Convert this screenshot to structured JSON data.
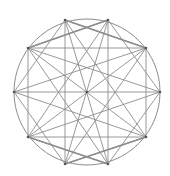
{
  "diagram": {
    "type": "geometric-construction",
    "canvas": {
      "width": 170,
      "height": 176,
      "background": "#ffffff"
    },
    "stroke_color": "#8c8c8c",
    "point_color": "#555555",
    "circle": {
      "cx": 87,
      "cy": 92,
      "r": 73
    },
    "center": {
      "x": 87,
      "y": 92
    },
    "points": [
      {
        "id": "T1",
        "x": 65,
        "y": 20
      },
      {
        "id": "T2",
        "x": 108,
        "y": 20
      },
      {
        "id": "R1",
        "x": 146,
        "y": 48
      },
      {
        "id": "R",
        "x": 160,
        "y": 92
      },
      {
        "id": "R2",
        "x": 146,
        "y": 137
      },
      {
        "id": "B2",
        "x": 108,
        "y": 164
      },
      {
        "id": "B1",
        "x": 65,
        "y": 164
      },
      {
        "id": "L2",
        "x": 28,
        "y": 137
      },
      {
        "id": "L",
        "x": 14,
        "y": 92
      },
      {
        "id": "L1",
        "x": 28,
        "y": 48
      }
    ],
    "chords": [
      [
        "L1",
        "R1"
      ],
      [
        "L2",
        "R2"
      ],
      [
        "L1",
        "L2"
      ],
      [
        "R1",
        "R2"
      ],
      [
        "L",
        "R"
      ],
      [
        "T1",
        "B2"
      ],
      [
        "T2",
        "B1"
      ],
      [
        "L1",
        "R2"
      ],
      [
        "R1",
        "L2"
      ],
      [
        "T1",
        "R1"
      ],
      [
        "T2",
        "L1"
      ],
      [
        "T1",
        "L"
      ],
      [
        "T2",
        "R"
      ],
      [
        "B1",
        "L"
      ],
      [
        "B2",
        "R"
      ],
      [
        "B1",
        "R2"
      ],
      [
        "B2",
        "L2"
      ],
      [
        "T1",
        "R2"
      ],
      [
        "T2",
        "L2"
      ],
      [
        "B1",
        "R1"
      ],
      [
        "B2",
        "L1"
      ],
      [
        "L",
        "R1"
      ],
      [
        "L",
        "R2"
      ],
      [
        "R",
        "L1"
      ],
      [
        "R",
        "L2"
      ],
      [
        "T1",
        "B1"
      ],
      [
        "T2",
        "B2"
      ],
      [
        "L1",
        "T2"
      ],
      [
        "R1",
        "T1"
      ],
      [
        "L2",
        "B2"
      ],
      [
        "R2",
        "B1"
      ]
    ],
    "thick_chords": [
      [
        "L1",
        "T2"
      ],
      [
        "R1",
        "T1"
      ],
      [
        "L2",
        "B2"
      ],
      [
        "R2",
        "B1"
      ]
    ]
  }
}
